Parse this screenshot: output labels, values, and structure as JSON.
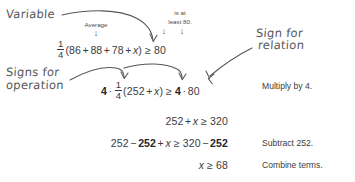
{
  "annotations": {
    "variable": "Variable",
    "sign_for_relation_l1": "Sign for",
    "sign_for_relation_l2": "relation",
    "signs_for_operation_l1": "Signs for",
    "signs_for_operation_l2": "operation"
  },
  "callouts": {
    "average": "Average",
    "is_at_least_l1": "is at",
    "is_at_least_l2": "least 80."
  },
  "equations": {
    "line1": {
      "frac_num": "1",
      "frac_den": "4",
      "open": "(",
      "a": "86",
      "plus1": "+",
      "b": "88",
      "plus2": "+",
      "c": "78",
      "plus3": "+",
      "x": "x",
      "close": ")",
      "rel": "≥",
      "rhs": "80"
    },
    "line2": {
      "coef": "4",
      "dot1": "·",
      "frac_num": "1",
      "frac_den": "4",
      "open": "(",
      "sum": "252",
      "plus": "+",
      "x": "x",
      "close": ")",
      "rel": "≥",
      "rcoef": "4",
      "dot2": "·",
      "rhs": "80"
    },
    "line3": {
      "lhs_num": "252",
      "plus": "+",
      "x": "x",
      "rel": "≥",
      "rhs": "320"
    },
    "line4": {
      "lhs_num": "252",
      "minus1": "−",
      "lhs_sub": "252",
      "plus": "+",
      "x": "x",
      "rel": "≥",
      "rhs_num": "320",
      "minus2": "−",
      "rhs_sub": "252"
    },
    "line5": {
      "x": "x",
      "rel": "≥",
      "rhs": "68"
    }
  },
  "reasons": {
    "step2": "Multiply by 4.",
    "step4": "Subtract 252.",
    "step5": "Combine terms."
  },
  "colors": {
    "ink": "#3b3c40",
    "bold_ink": "#25262a",
    "hand_ink": "#55565a",
    "background": "#ffffff"
  }
}
